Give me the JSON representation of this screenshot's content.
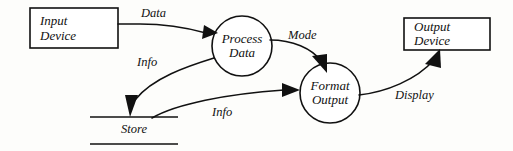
{
  "diagram": {
    "type": "data-flow-diagram",
    "background_color": "#fdfdfb",
    "ink_color": "#111111",
    "external_entities": [
      {
        "id": "input-device",
        "label_line1": "Input",
        "label_line2": "Device",
        "shape": "rectangle"
      },
      {
        "id": "output-device",
        "label_line1": "Output",
        "label_line2": "Device",
        "shape": "rectangle"
      }
    ],
    "processes": [
      {
        "id": "process-data",
        "label_line1": "Process",
        "label_line2": "Data",
        "shape": "circle"
      },
      {
        "id": "format-output",
        "label_line1": "Format",
        "label_line2": "Output",
        "shape": "circle"
      }
    ],
    "data_stores": [
      {
        "id": "store",
        "label": "Store",
        "shape": "open-rectangle"
      }
    ],
    "flows": [
      {
        "id": "flow-data",
        "label": "Data",
        "from": "input-device",
        "to": "process-data"
      },
      {
        "id": "flow-info-to-store",
        "label": "Info",
        "from": "process-data",
        "to": "store"
      },
      {
        "id": "flow-mode",
        "label": "Mode",
        "from": "process-data",
        "to": "format-output"
      },
      {
        "id": "flow-info-from-store",
        "label": "Info",
        "from": "store",
        "to": "format-output"
      },
      {
        "id": "flow-display",
        "label": "Display",
        "from": "format-output",
        "to": "output-device"
      }
    ]
  }
}
